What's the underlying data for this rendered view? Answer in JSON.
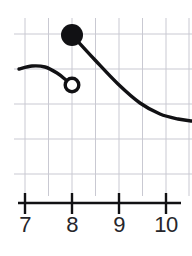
{
  "figure": {
    "kind": "function-graph-on-grid",
    "background_color": "#ffffff",
    "grid_color": "#c9c9d2",
    "ink_color": "#111114",
    "label_color": "#26262b",
    "width": 192,
    "height": 256
  },
  "axis": {
    "name": "x-axis",
    "line": {
      "x1": 18,
      "x2": 181,
      "y": 203
    },
    "tick_length_up": 10,
    "tick_length_down": 11,
    "ticks": [
      {
        "label": "7",
        "x": 25
      },
      {
        "label": "8",
        "x": 72
      },
      {
        "label": "9",
        "x": 119
      },
      {
        "label": "10",
        "x": 166
      }
    ],
    "label_y": 214
  },
  "grid": {
    "vertical_x": [
      25,
      48.5,
      72,
      95.5,
      119,
      142.5,
      166,
      189
    ],
    "horizontal_y": [
      34,
      69,
      104,
      139,
      174
    ],
    "extent": {
      "top": 18,
      "bottom": 196,
      "left": 14,
      "right": 192
    }
  },
  "chart_data": {
    "type": "line",
    "title": "",
    "xlabel": "",
    "ylabel": "",
    "xlim": [
      7,
      10
    ],
    "ylim": [
      0,
      1
    ],
    "grid": true,
    "legend": null,
    "xticks": [
      7,
      8,
      9,
      10
    ],
    "xticklabels": [
      "7",
      "8",
      "9",
      "10"
    ],
    "series": [
      {
        "name": "left-branch",
        "note": "rises gently from left edge then falls to an open endpoint at x = 8",
        "endpoint_marker": "open-circle",
        "points_px": [
          [
            19,
            69
          ],
          [
            32,
            66
          ],
          [
            45,
            67
          ],
          [
            57,
            73
          ],
          [
            66,
            80
          ],
          [
            72,
            85
          ]
        ],
        "points_data": [
          [
            6.62,
            0.755
          ],
          [
            7.15,
            0.772
          ],
          [
            7.7,
            0.766
          ],
          [
            8.0,
            0.75
          ]
        ]
      },
      {
        "name": "right-branch",
        "note": "starts at a filled endpoint at x = 8 and decreases, flattening toward the right edge",
        "endpoint_marker": "filled-dot",
        "points_px": [
          [
            72,
            35
          ],
          [
            95,
            60
          ],
          [
            118,
            84
          ],
          [
            140,
            103
          ],
          [
            160,
            114
          ],
          [
            178,
            119
          ],
          [
            192,
            121
          ]
        ],
        "points_data": [
          [
            8.0,
            0.95
          ],
          [
            9.0,
            0.72
          ],
          [
            10.0,
            0.47
          ]
        ]
      }
    ],
    "markers": [
      {
        "name": "filled-dot",
        "style": "filled",
        "x_px": 72,
        "y_px": 35,
        "radius_px": 11,
        "x_data": 8,
        "meaning": "function value at x = 8 (included)"
      },
      {
        "name": "open-circle",
        "style": "open",
        "x_px": 72,
        "y_px": 85,
        "radius_px": 9,
        "x_data": 8,
        "meaning": "limit from the left at x = 8 (excluded)"
      }
    ]
  }
}
